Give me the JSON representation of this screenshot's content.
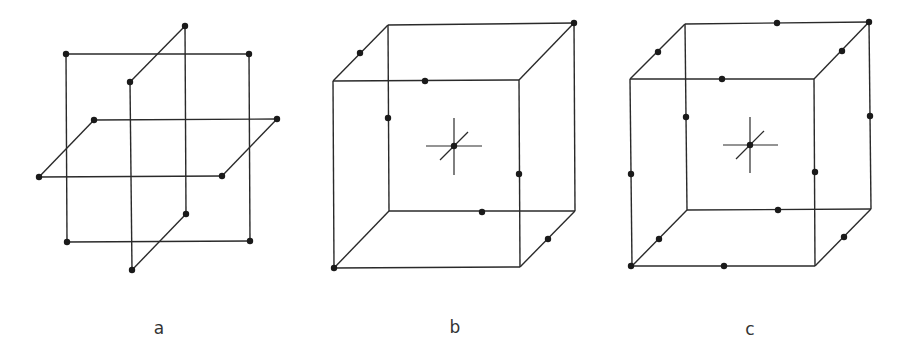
{
  "figures": [
    {
      "id": "a",
      "label": "a",
      "label_pos": [
        159,
        328
      ],
      "description": "Three intersecting orthogonal planes (simple cubic planes)",
      "edges": [
        [
          [
            66,
            54
          ],
          [
            249,
            54
          ]
        ],
        [
          [
            66,
            54
          ],
          [
            67,
            242
          ]
        ],
        [
          [
            249,
            54
          ],
          [
            250,
            241
          ]
        ],
        [
          [
            67,
            242
          ],
          [
            250,
            241
          ]
        ],
        [
          [
            130,
            82
          ],
          [
            185,
            26
          ]
        ],
        [
          [
            185,
            26
          ],
          [
            186,
            214
          ]
        ],
        [
          [
            130,
            82
          ],
          [
            132,
            270
          ]
        ],
        [
          [
            132,
            270
          ],
          [
            186,
            214
          ]
        ],
        [
          [
            94,
            120
          ],
          [
            277,
            119
          ]
        ],
        [
          [
            94,
            120
          ],
          [
            39,
            177
          ]
        ],
        [
          [
            39,
            177
          ],
          [
            222,
            176
          ]
        ],
        [
          [
            222,
            176
          ],
          [
            277,
            119
          ]
        ]
      ],
      "dots": [
        [
          66,
          54
        ],
        [
          249,
          54
        ],
        [
          67,
          242
        ],
        [
          250,
          241
        ],
        [
          185,
          26
        ],
        [
          130,
          82
        ],
        [
          132,
          270
        ],
        [
          186,
          214
        ],
        [
          94,
          120
        ],
        [
          277,
          119
        ],
        [
          39,
          177
        ],
        [
          222,
          176
        ]
      ],
      "cross": null
    },
    {
      "id": "b",
      "label": "b",
      "label_pos": [
        455,
        327
      ],
      "description": "Cube with center atom and face-edge sites",
      "edges": [
        [
          [
            333,
            81
          ],
          [
            519,
            80
          ]
        ],
        [
          [
            519,
            80
          ],
          [
            520,
            267
          ]
        ],
        [
          [
            520,
            267
          ],
          [
            334,
            268
          ]
        ],
        [
          [
            334,
            268
          ],
          [
            333,
            81
          ]
        ],
        [
          [
            388,
            25
          ],
          [
            574,
            23
          ]
        ],
        [
          [
            574,
            23
          ],
          [
            575,
            211
          ]
        ],
        [
          [
            575,
            211
          ],
          [
            389,
            211
          ]
        ],
        [
          [
            389,
            211
          ],
          [
            388,
            25
          ]
        ],
        [
          [
            333,
            81
          ],
          [
            388,
            25
          ]
        ],
        [
          [
            519,
            80
          ],
          [
            574,
            23
          ]
        ],
        [
          [
            520,
            267
          ],
          [
            575,
            211
          ]
        ],
        [
          [
            334,
            268
          ],
          [
            389,
            211
          ]
        ]
      ],
      "dots": [
        [
          574,
          23
        ],
        [
          360,
          53
        ],
        [
          425,
          81
        ],
        [
          388,
          118
        ],
        [
          454,
          146
        ],
        [
          519,
          174
        ],
        [
          482,
          212
        ],
        [
          548,
          239
        ],
        [
          334,
          268
        ]
      ],
      "cross": {
        "center": [
          454,
          146
        ],
        "h": [
          [
            426,
            146
          ],
          [
            482,
            146
          ]
        ],
        "v": [
          [
            454,
            118
          ],
          [
            454,
            175
          ]
        ],
        "d": [
          [
            440,
            160
          ],
          [
            468,
            132
          ]
        ]
      }
    },
    {
      "id": "c",
      "label": "c",
      "label_pos": [
        750,
        329
      ],
      "description": "Cube with center atom and all edge-midpoint sites",
      "edges": [
        [
          [
            630,
            79
          ],
          [
            814,
            79
          ]
        ],
        [
          [
            814,
            79
          ],
          [
            815,
            266
          ]
        ],
        [
          [
            815,
            266
          ],
          [
            632,
            266
          ]
        ],
        [
          [
            632,
            266
          ],
          [
            630,
            79
          ]
        ],
        [
          [
            685,
            24
          ],
          [
            869,
            22
          ]
        ],
        [
          [
            869,
            22
          ],
          [
            871,
            209
          ]
        ],
        [
          [
            871,
            209
          ],
          [
            687,
            210
          ]
        ],
        [
          [
            687,
            210
          ],
          [
            685,
            24
          ]
        ],
        [
          [
            630,
            79
          ],
          [
            685,
            24
          ]
        ],
        [
          [
            814,
            79
          ],
          [
            869,
            22
          ]
        ],
        [
          [
            815,
            266
          ],
          [
            871,
            209
          ]
        ],
        [
          [
            632,
            266
          ],
          [
            687,
            210
          ]
        ]
      ],
      "dots": [
        [
          777,
          23
        ],
        [
          869,
          22
        ],
        [
          658,
          52
        ],
        [
          842,
          51
        ],
        [
          722,
          79
        ],
        [
          686,
          117
        ],
        [
          870,
          116
        ],
        [
          631,
          174
        ],
        [
          815,
          172
        ],
        [
          750,
          145
        ],
        [
          778,
          210
        ],
        [
          659,
          239
        ],
        [
          844,
          237
        ],
        [
          631,
          266
        ],
        [
          724,
          266
        ]
      ],
      "cross": {
        "center": [
          750,
          145
        ],
        "h": [
          [
            723,
            145
          ],
          [
            778,
            145
          ]
        ],
        "v": [
          [
            750,
            117
          ],
          [
            750,
            173
          ]
        ],
        "d": [
          [
            736,
            159
          ],
          [
            764,
            131
          ]
        ]
      }
    }
  ],
  "style": {
    "line_color": "#2a2a2a",
    "dot_color": "#1a1a1a",
    "dot_radius": 3.2,
    "background": "#ffffff"
  }
}
